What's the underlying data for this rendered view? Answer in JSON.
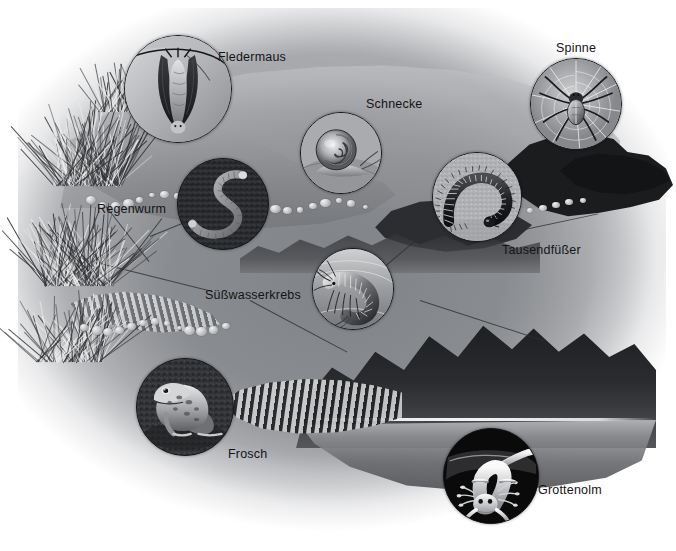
{
  "figure": {
    "style": "grayscale airbrush illustration",
    "background_color": "#ffffff",
    "scene_color": "#8b8d91",
    "label_color": "#141416",
    "void_color": "#1b1c1e"
  },
  "labels": [
    {
      "id": "fledermaus",
      "text": "Fledermaus",
      "x": 218,
      "y": 50,
      "icon": "bat-icon"
    },
    {
      "id": "schnecke",
      "text": "Schnecke",
      "x": 366,
      "y": 97,
      "icon": "snail-icon"
    },
    {
      "id": "spinne",
      "text": "Spinne",
      "x": 556,
      "y": 41,
      "icon": "spider-icon"
    },
    {
      "id": "regenwurm",
      "text": "Regenwurm",
      "x": 97,
      "y": 202,
      "icon": "earthworm-icon"
    },
    {
      "id": "tausendfusser",
      "text": "Tausendfüßer",
      "x": 502,
      "y": 243,
      "icon": "millipede-icon"
    },
    {
      "id": "suesswasserkrebs",
      "text": "Süßwasserkrebs",
      "x": 205,
      "y": 288,
      "icon": "freshwater-crustacean-icon"
    },
    {
      "id": "frosch",
      "text": "Frosch",
      "x": 228,
      "y": 447,
      "icon": "frog-icon"
    },
    {
      "id": "grottenolm",
      "text": "Grottenolm",
      "x": 538,
      "y": 483,
      "icon": "olm-icon"
    }
  ],
  "insets": [
    {
      "id": "fledermaus",
      "name": "bat-inset",
      "x": 124,
      "y": 35,
      "size": 106,
      "tone": "light"
    },
    {
      "id": "schnecke",
      "name": "snail-inset",
      "x": 300,
      "y": 112,
      "size": 80,
      "tone": "light"
    },
    {
      "id": "spinne",
      "name": "spider-inset",
      "x": 530,
      "y": 58,
      "size": 90,
      "tone": "light"
    },
    {
      "id": "regenwurm",
      "name": "earthworm-inset",
      "x": 177,
      "y": 158,
      "size": 90,
      "tone": "dark"
    },
    {
      "id": "tausendfusser",
      "name": "millipede-inset",
      "x": 432,
      "y": 152,
      "size": 88,
      "tone": "light"
    },
    {
      "id": "suesswasserkrebs",
      "name": "freshwater-crustacean-inset",
      "x": 312,
      "y": 248,
      "size": 80,
      "tone": "light"
    },
    {
      "id": "frosch",
      "name": "frog-inset",
      "x": 136,
      "y": 358,
      "size": 96,
      "tone": "dark"
    },
    {
      "id": "grottenolm",
      "name": "olm-inset",
      "x": 443,
      "y": 428,
      "size": 94,
      "tone": "black"
    }
  ]
}
